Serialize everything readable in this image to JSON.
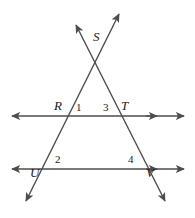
{
  "figure": {
    "type": "geometry-diagram",
    "canvas": {
      "width": 195,
      "height": 218
    },
    "background_color": "#ffffff",
    "stroke_color": "#4d4d4d",
    "label_color": "#1b1b1b",
    "stroke_width": 1.4
  },
  "points": [
    {
      "name": "S",
      "label": "S",
      "x": 96,
      "y": 62,
      "label_x": 93,
      "label_y": 36,
      "role": "apex-intersection"
    },
    {
      "name": "R",
      "label": "R",
      "x": 70,
      "y": 116,
      "label_x": 55,
      "label_y": 100,
      "role": "upper-left-intersection"
    },
    {
      "name": "T",
      "label": "T",
      "x": 122,
      "y": 116,
      "label_x": 121,
      "label_y": 100,
      "role": "upper-right-intersection"
    },
    {
      "name": "U",
      "label": "U",
      "x": 43,
      "y": 169,
      "label_x": 31,
      "label_y": 171,
      "role": "lower-left-intersection"
    },
    {
      "name": "V",
      "label": "V",
      "x": 149,
      "y": 169,
      "label_x": 147,
      "label_y": 171,
      "role": "lower-right-intersection"
    }
  ],
  "angles": [
    {
      "name": "angle-1",
      "label": "1",
      "x": 76,
      "y": 101,
      "at_vertex": "R",
      "position": "right-of-R-above-line"
    },
    {
      "name": "angle-3",
      "label": "3",
      "x": 102,
      "y": 101,
      "at_vertex": "T",
      "position": "left-of-T-above-line"
    },
    {
      "name": "angle-2",
      "label": "2",
      "x": 55,
      "y": 155,
      "at_vertex": "U",
      "position": "right-of-U-above-line"
    },
    {
      "name": "angle-4",
      "label": "4",
      "x": 128,
      "y": 155,
      "at_vertex": "V",
      "position": "left-of-V-above-line"
    }
  ],
  "lines": [
    {
      "name": "upper-horizontal-line",
      "kind": "horizontal-parallel-line",
      "x1": 10,
      "y1": 116,
      "x2": 186,
      "y2": 116,
      "arrowheads": [
        "left-end",
        "right-inner",
        "right-end"
      ]
    },
    {
      "name": "lower-horizontal-line",
      "kind": "horizontal-parallel-line",
      "x1": 10,
      "y1": 169,
      "x2": 186,
      "y2": 169,
      "arrowheads": [
        "left-end",
        "right-inner",
        "right-end"
      ]
    },
    {
      "name": "transversal-left",
      "kind": "transversal",
      "through": [
        "S",
        "R",
        "U"
      ],
      "x1": 119,
      "y1": 12,
      "x2": 25,
      "y2": 203,
      "arrowheads": [
        "upper-right-end",
        "lower-left-end"
      ]
    },
    {
      "name": "transversal-right",
      "kind": "transversal",
      "through": [
        "S",
        "T",
        "V"
      ],
      "x1": 75,
      "y1": 23,
      "x2": 166,
      "y2": 203,
      "arrowheads": [
        "upper-left-end",
        "lower-right-end"
      ]
    }
  ]
}
